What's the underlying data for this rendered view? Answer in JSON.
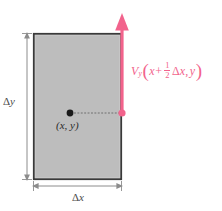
{
  "figure": {
    "type": "control-volume-diagram",
    "background_color": "#ffffff",
    "width": 222,
    "height": 211
  },
  "rectangle": {
    "fill_color": "#bdbdbd",
    "border_color": "#3a3a3a",
    "x": 33,
    "y": 33,
    "width": 89,
    "height": 147
  },
  "labels": {
    "delta_y": {
      "greek": "Δ",
      "variable": "y"
    },
    "delta_x": {
      "greek": "Δ",
      "variable": "x"
    },
    "center_point": "(x, y)",
    "velocity": {
      "symbol": "V",
      "subscript": "y",
      "open_paren": "(",
      "arg_x": "x",
      "operator": "+",
      "fraction_numerator": "1",
      "fraction_denominator": "2",
      "delta_greek": "Δ",
      "delta_variable": "x",
      "comma": ",",
      "arg_y": "y",
      "close_paren": ")",
      "color": "#f2638c",
      "full_text": "V_y(x + 1/2 Δx, y)"
    }
  },
  "markers": {
    "center_dot": {
      "color": "#1a1a1a",
      "cx": 70,
      "cy": 113,
      "r": 3.4
    },
    "edge_dot": {
      "color": "#f2638c",
      "cx": 122,
      "cy": 113,
      "r": 3.4
    }
  },
  "arrow": {
    "color": "#f2638c",
    "direction": "up",
    "from_y": 113,
    "to_y": 18,
    "x": 122,
    "line_width": 3.2
  },
  "connector": {
    "style": "dotted",
    "color": "#6e6e6e",
    "from_x": 70,
    "to_x": 122,
    "y": 113
  },
  "dimension_lines": {
    "color": "#8c8c8c",
    "vertical": {
      "x": 27,
      "from_y": 33,
      "to_y": 180
    },
    "horizontal": {
      "y": 186,
      "from_x": 33,
      "to_x": 122
    }
  }
}
